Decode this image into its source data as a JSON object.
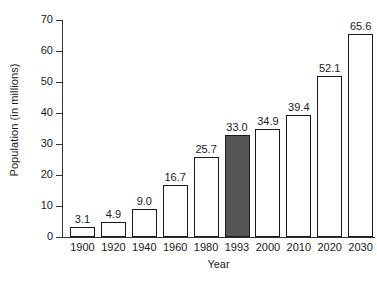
{
  "chart_data": {
    "type": "bar",
    "title": "",
    "xlabel": "Year",
    "ylabel": "Population (in millions)",
    "categories": [
      "1900",
      "1920",
      "1940",
      "1960",
      "1980",
      "1993",
      "2000",
      "2010",
      "2020",
      "2030"
    ],
    "values": [
      3.1,
      4.9,
      9.0,
      16.7,
      25.7,
      33.0,
      34.9,
      39.4,
      52.1,
      65.6
    ],
    "value_labels": [
      "3.1",
      "4.9",
      "9.0",
      "16.7",
      "25.7",
      "33.0",
      "34.9",
      "39.4",
      "52.1",
      "65.6"
    ],
    "highlighted_index": 5,
    "highlight_color": "#555555",
    "bar_fill_color": "#ffffff",
    "bar_border_color": "#1a1a1a",
    "ylim": [
      0,
      70
    ],
    "ytick_values": [
      0,
      10,
      20,
      30,
      40,
      50,
      60,
      70
    ],
    "ytick_labels": [
      "0",
      "10",
      "20",
      "30",
      "40",
      "50",
      "60",
      "70"
    ],
    "grid": false,
    "legend": "none"
  },
  "axes": {
    "y_title": "Population (in millions)",
    "x_title": "Year"
  }
}
